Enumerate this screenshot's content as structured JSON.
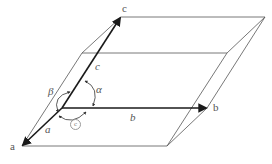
{
  "diagram": {
    "axis_end_labels": {
      "a": "a",
      "b": "b",
      "c": "c"
    },
    "axis_edge_labels": {
      "a": "a",
      "b": "b",
      "c": "c"
    },
    "angle_labels": {
      "alpha": "α",
      "beta": "β",
      "gamma": "c"
    },
    "colors": {
      "axis": "#1a1a1a",
      "edge": "#555555",
      "label": "#555555"
    }
  }
}
